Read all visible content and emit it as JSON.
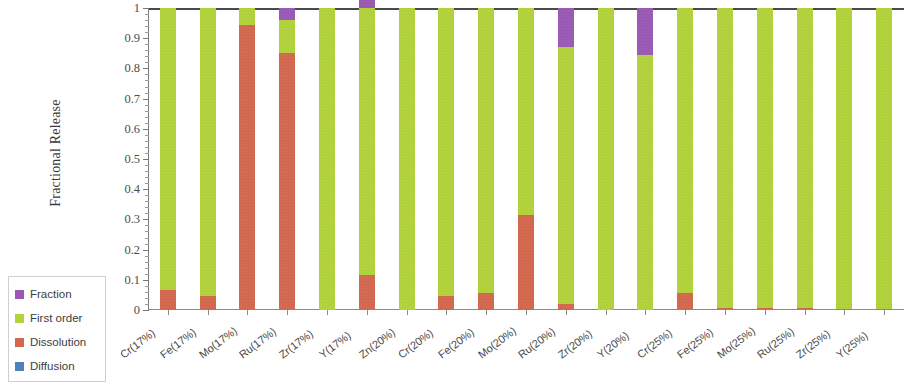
{
  "chart_data": {
    "type": "bar",
    "stacked": true,
    "title": "",
    "xlabel": "",
    "ylabel": "Fractional Release",
    "ylim": [
      0,
      1
    ],
    "ytick_labels": [
      "0",
      "0.1",
      "0.2",
      "0.3",
      "0.4",
      "0.5",
      "0.6",
      "0.7",
      "0.8",
      "0.9",
      "1"
    ],
    "ytick_values": [
      0,
      0.1,
      0.2,
      0.3,
      0.4,
      0.5,
      0.6,
      0.7,
      0.8,
      0.9,
      1
    ],
    "grid": false,
    "minor_ticks": true,
    "legend_position": "bottom-left",
    "categories": [
      "Cr(17%)",
      "Fe(17%)",
      "Mo(17%)",
      "Ru(17%)",
      "Zr(17%)",
      "Y(17%)",
      "Zn(20%)",
      "Cr(20%)",
      "Fe(20%)",
      "Mo(20%)",
      "Ru(20%)",
      "Zr(20%)",
      "Y(20%)",
      "Cr(25%)",
      "Fe(25%)",
      "Mo(25%)",
      "Ru(25%)",
      "Zr(25%)",
      "Y(25%)"
    ],
    "series": [
      {
        "name": "Diffusion",
        "color": "#4f81bd",
        "values": [
          0,
          0,
          0,
          0,
          0,
          0,
          0,
          0,
          0,
          0,
          0,
          0,
          0,
          0,
          0,
          0,
          0,
          0,
          0
        ]
      },
      {
        "name": "Dissolution",
        "color": "#d4684f",
        "values": [
          0.065,
          0.045,
          0.945,
          0.85,
          0.0,
          0.115,
          0.0,
          0.048,
          0.055,
          0.315,
          0.02,
          0.0,
          0.0,
          0.055,
          0.008,
          0.006,
          0.006,
          0.005,
          0.004
        ]
      },
      {
        "name": "First order",
        "color": "#b3d33b",
        "values": [
          0.935,
          0.955,
          0.055,
          0.11,
          1.0,
          0.885,
          1.0,
          0.952,
          0.945,
          0.685,
          0.85,
          1.0,
          0.845,
          0.945,
          0.992,
          0.994,
          0.994,
          0.995,
          0.996
        ]
      },
      {
        "name": "Fraction",
        "color": "#9b59b6",
        "values": [
          0,
          0,
          0,
          0.04,
          0,
          0.045,
          0,
          0,
          0,
          0,
          0.13,
          0,
          0.155,
          0,
          0,
          0,
          0,
          0,
          0
        ]
      }
    ]
  },
  "legend": {
    "items": [
      {
        "label": "Fraction",
        "color": "#9b59b6"
      },
      {
        "label": "First order",
        "color": "#b3d33b"
      },
      {
        "label": "Dissolution",
        "color": "#d4684f"
      },
      {
        "label": "Diffusion",
        "color": "#4f81bd"
      }
    ]
  }
}
